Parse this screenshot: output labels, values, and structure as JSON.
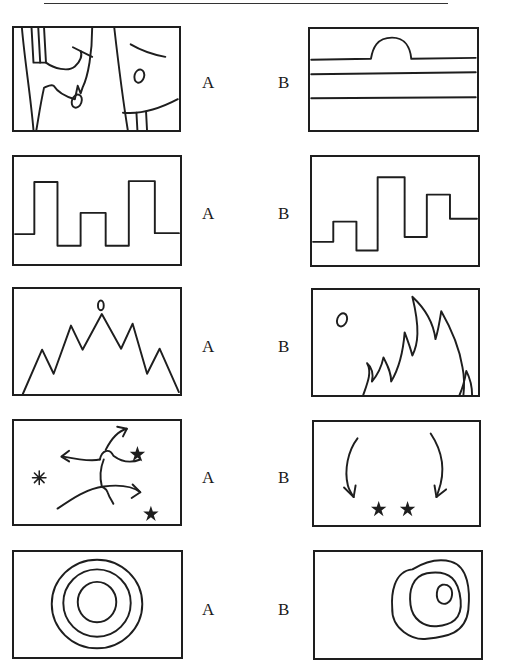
{
  "page": {
    "header_text_partial": "",
    "figure_pairs": [
      {
        "row": 1,
        "left_label": "A",
        "right_label": "B",
        "left_figure": "abstract-figure-with-faces-icon",
        "right_figure": "horizon-with-semicircle-icon"
      },
      {
        "row": 2,
        "left_label": "A",
        "right_label": "B",
        "left_figure": "symmetric-square-wave-icon",
        "right_figure": "asymmetric-square-wave-icon"
      },
      {
        "row": 3,
        "left_label": "A",
        "right_label": "B",
        "left_figure": "symmetric-mountain-peaks-icon",
        "right_figure": "asymmetric-flame-peaks-icon"
      },
      {
        "row": 4,
        "left_label": "A",
        "right_label": "B",
        "left_figure": "scattered-arrows-and-stars-icon",
        "right_figure": "converging-arrows-and-stars-icon"
      },
      {
        "row": 5,
        "left_label": "A",
        "right_label": "B",
        "left_figure": "concentric-circles-icon",
        "right_figure": "offset-nested-circles-icon"
      }
    ]
  }
}
